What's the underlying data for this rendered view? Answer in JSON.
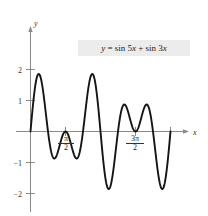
{
  "chart_data": {
    "type": "line",
    "title": "",
    "equation_label": "y = sin 5x + sin 3x",
    "xlabel": "x",
    "ylabel": "y",
    "xlim": [
      -0.45,
      7.3
    ],
    "ylim": [
      -2.55,
      2.45
    ],
    "grid": false,
    "legend": null,
    "x_tick_labels": [
      {
        "value": 1.5708,
        "num": "π",
        "den": "2",
        "display": "π/2"
      },
      {
        "value": 4.7124,
        "num": "3π",
        "den": "2",
        "display": "3π/2"
      }
    ],
    "y_tick_labels": [
      {
        "value": 2,
        "display": "2"
      },
      {
        "value": 1,
        "display": "1"
      },
      {
        "value": -1,
        "display": "−1"
      },
      {
        "value": -2,
        "display": "−2"
      }
    ],
    "series": [
      {
        "name": "y = sin 5x + sin 3x",
        "formula": "sin(5*x) + sin(3*x)",
        "domain": [
          0,
          6.2832
        ],
        "samples": 400,
        "color": "#151515",
        "key_points": [
          {
            "x": 0.0,
            "y": 0.0,
            "kind": "start-zero"
          },
          {
            "x": 0.3927,
            "y": 1.848,
            "kind": "max"
          },
          {
            "x": 0.7854,
            "y": 0.0,
            "kind": "zero"
          },
          {
            "x": 1.178,
            "y": -0.848,
            "kind": "local-min"
          },
          {
            "x": 1.5708,
            "y": 0.0,
            "kind": "zero"
          },
          {
            "x": 1.963,
            "y": -0.848,
            "kind": "local-min"
          },
          {
            "x": 2.356,
            "y": 0.0,
            "kind": "zero"
          },
          {
            "x": 2.749,
            "y": 1.848,
            "kind": "max"
          },
          {
            "x": 3.1416,
            "y": 0.0,
            "kind": "zero"
          },
          {
            "x": 3.534,
            "y": -1.848,
            "kind": "min"
          },
          {
            "x": 3.927,
            "y": 0.0,
            "kind": "zero"
          },
          {
            "x": 4.319,
            "y": 0.848,
            "kind": "local-max"
          },
          {
            "x": 4.7124,
            "y": 0.0,
            "kind": "zero"
          },
          {
            "x": 5.105,
            "y": 0.848,
            "kind": "local-max"
          },
          {
            "x": 5.498,
            "y": 0.0,
            "kind": "zero"
          },
          {
            "x": 5.89,
            "y": -1.848,
            "kind": "min"
          },
          {
            "x": 6.2832,
            "y": 0.0,
            "kind": "end-zero"
          }
        ]
      }
    ],
    "axis_arrows": {
      "x": true,
      "y": true
    },
    "colors": {
      "curve": "#151515",
      "axis": "#8a8a8a",
      "label_box_background": "#ececec",
      "text": "#1a1a1a",
      "page_background": "#ffffff"
    }
  },
  "annotations": {
    "equation": {
      "lhs": "y",
      "eq": "=",
      "rhs_part1": "sin 5",
      "rhs_var1": "x",
      "plus": "+",
      "rhs_part2": "sin 3",
      "rhs_var2": "x"
    }
  },
  "axes": {
    "y_axis_name": "y",
    "x_axis_name": "x"
  }
}
